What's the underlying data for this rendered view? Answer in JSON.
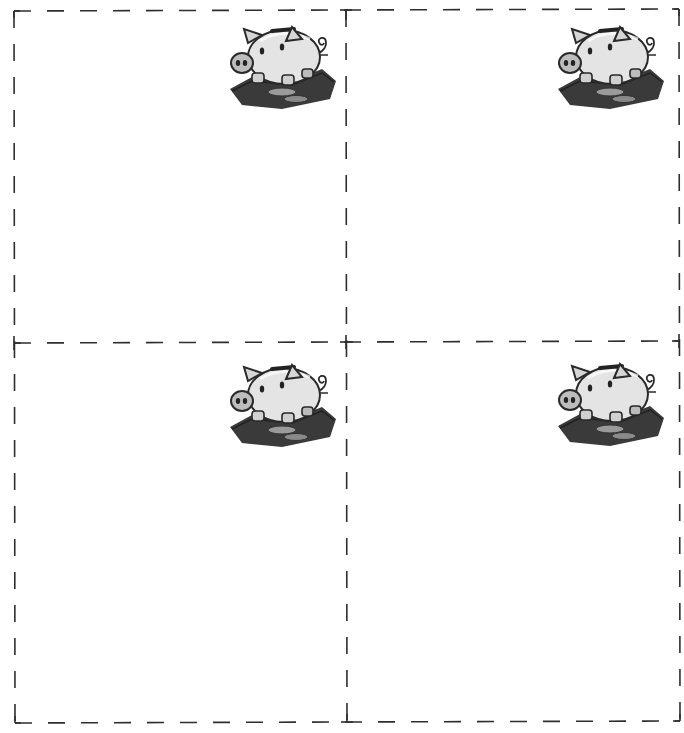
{
  "sheet": {
    "layout": "2x2 cut-out cards",
    "line_color": "#2e2e2e",
    "cards": [
      {
        "position": "top-left",
        "icon": "piggy-bank-icon",
        "text": ""
      },
      {
        "position": "top-right",
        "icon": "piggy-bank-icon",
        "text": ""
      },
      {
        "position": "bottom-left",
        "icon": "piggy-bank-icon",
        "text": ""
      },
      {
        "position": "bottom-right",
        "icon": "piggy-bank-icon",
        "text": ""
      }
    ]
  }
}
